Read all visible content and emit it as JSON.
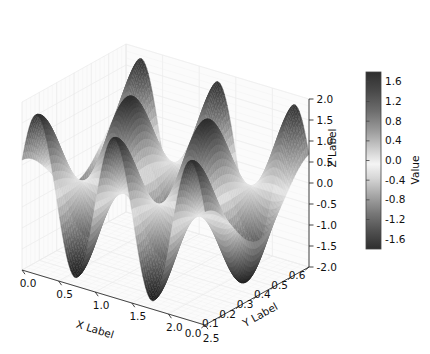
{
  "figure": {
    "background_color": "#ffffff",
    "width": 430,
    "height": 354
  },
  "axes": {
    "x": {
      "title": "X Label",
      "ticks": [
        "0.0",
        "0.5",
        "1.0",
        "1.5",
        "2.0",
        "2.5"
      ],
      "values": [
        0.0,
        0.5,
        1.0,
        1.5,
        2.0,
        2.5
      ],
      "range": [
        0.0,
        2.5
      ]
    },
    "y": {
      "title": "Y Label",
      "ticks": [
        "0.0",
        "0.1",
        "0.2",
        "0.3",
        "0.4",
        "0.5",
        "0.6"
      ],
      "values": [
        0.0,
        0.1,
        0.2,
        0.3,
        0.4,
        0.5,
        0.6
      ],
      "range": [
        0.0,
        0.6
      ]
    },
    "z": {
      "title": "Z Label",
      "ticks": [
        "-2.0",
        "-1.5",
        "-1.0",
        "-0.5",
        "0.0",
        "0.5",
        "1.0",
        "1.5",
        "2.0"
      ],
      "values": [
        -2.0,
        -1.5,
        -1.0,
        -0.5,
        0.0,
        0.5,
        1.0,
        1.5,
        2.0
      ],
      "range": [
        -2.0,
        2.0
      ]
    }
  },
  "colorbar": {
    "title": "Value",
    "ticks": [
      "1.6",
      "1.2",
      "0.8",
      "0.4",
      "0.0",
      "-0.4",
      "-0.8",
      "-1.2",
      "-1.6"
    ],
    "values": [
      1.6,
      1.2,
      0.8,
      0.4,
      0.0,
      -0.4,
      -0.8,
      -1.2,
      -1.6
    ],
    "range": [
      -1.8,
      1.8
    ],
    "colormap": "binary-gray-diverging",
    "stops": [
      "#3a3a3a",
      "#6f6f6f",
      "#a8a8a8",
      "#d8d8d8",
      "#f2f2f2",
      "#d8d8d8",
      "#a8a8a8",
      "#6f6f6f",
      "#3a3a3a"
    ]
  },
  "chart_data": {
    "type": "surface",
    "title": "",
    "xlabel": "X Label",
    "ylabel": "Y Label",
    "zlabel": "Z Label",
    "clabel": "Value",
    "xlim": [
      0.0,
      2.5
    ],
    "ylim": [
      0.0,
      0.6
    ],
    "zlim": [
      -2.0,
      2.0
    ],
    "clim": [
      -1.8,
      1.8
    ],
    "grid": true,
    "legend": "none",
    "projection": "3d",
    "colormap": "gray",
    "surface_function": "z = 1.8 * sin(2*pi*x/1.05 + 0.35) * cos(2*pi*y/0.62)",
    "x": [
      0.0,
      0.25,
      0.5,
      0.75,
      1.0,
      1.25,
      1.5,
      1.75,
      2.0,
      2.25,
      2.5
    ],
    "y": [
      0.0,
      0.1,
      0.2,
      0.3,
      0.4,
      0.5,
      0.6
    ],
    "z": [
      [
        0.62,
        0.45,
        0.01,
        -0.45,
        -0.62,
        -0.45,
        -0.01
      ],
      [
        1.55,
        1.12,
        0.03,
        -1.11,
        -1.54,
        -1.12,
        -0.03
      ],
      [
        1.7,
        1.23,
        0.03,
        -1.22,
        -1.69,
        -1.23,
        -0.03
      ],
      [
        0.95,
        0.69,
        0.02,
        -0.68,
        -0.94,
        -0.69,
        -0.02
      ],
      [
        -0.25,
        -0.18,
        0.0,
        0.18,
        0.25,
        0.18,
        0.0
      ],
      [
        -1.32,
        -0.96,
        -0.02,
        0.95,
        1.31,
        0.96,
        0.02
      ],
      [
        -1.79,
        -1.29,
        -0.03,
        1.28,
        1.78,
        1.29,
        0.03
      ],
      [
        -1.4,
        -1.01,
        -0.02,
        1.01,
        1.39,
        1.01,
        0.02
      ],
      [
        -0.38,
        -0.27,
        -0.01,
        0.27,
        0.38,
        0.27,
        0.01
      ],
      [
        0.84,
        0.61,
        0.01,
        -0.6,
        -0.83,
        -0.61,
        -0.01
      ],
      [
        1.67,
        1.21,
        0.03,
        -1.2,
        -1.66,
        -1.21,
        -0.03
      ]
    ],
    "z_min": -1.8,
    "z_max": 1.8,
    "peaks_visible": 3,
    "valleys_visible": 3
  }
}
